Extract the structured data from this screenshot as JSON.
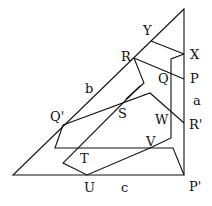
{
  "diagram": {
    "labels": {
      "Y": "Y",
      "X": "X",
      "R": "R",
      "P": "P",
      "Q": "Q",
      "b": "b",
      "a": "a",
      "Qp": "Q'",
      "S": "S",
      "W": "W",
      "Rp": "R'",
      "T": "T",
      "V": "V",
      "U": "U",
      "c": "c",
      "Pp": "P'"
    },
    "stroke_color": "#111111"
  }
}
